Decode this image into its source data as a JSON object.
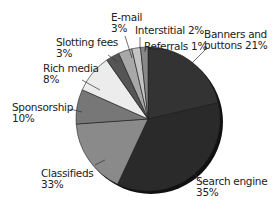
{
  "chart_data": {
    "type": "pie",
    "title": "",
    "labels": [
      "Banners and buttons",
      "Search engine",
      "Classifieds",
      "Sponsorship",
      "Rich media",
      "Slotting fees",
      "E-mail",
      "Interstitial",
      "Referrals"
    ],
    "values": [
      21,
      35,
      33,
      10,
      8,
      3,
      3,
      2,
      1
    ],
    "value_labels": [
      "21%",
      "35%",
      "33%",
      "10%",
      "8%",
      "3%",
      "3%",
      "2%",
      "1%"
    ],
    "visual_angles_deg": [
      [
        0,
        77
      ],
      [
        77,
        205
      ],
      [
        205,
        266
      ],
      [
        266,
        294
      ],
      [
        294,
        325
      ],
      [
        325,
        336
      ],
      [
        336,
        347
      ],
      [
        347,
        354
      ],
      [
        354,
        360
      ]
    ],
    "colors": [
      "#333333",
      "#2a2a2a",
      "#8a8a8a",
      "#777777",
      "#ececec",
      "#555555",
      "#a8a8a8",
      "#c4c4c4",
      "#888888"
    ],
    "legend": "none (direct labels)"
  },
  "labels": {
    "banners": "Banners and\nbuttons 21%",
    "search": "Search engine\n35%",
    "classifieds": "Classifieds\n33%",
    "sponsorship": "Sponsorship\n10%",
    "rich": "Rich media\n8%",
    "slotting": "Slotting fees\n3%",
    "email": "E-mail\n3%",
    "interstitial": "Interstitial 2%",
    "referrals": "Referrals 1%"
  }
}
